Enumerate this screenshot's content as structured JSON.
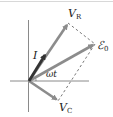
{
  "diagram": {
    "type": "phasor-diagram",
    "labels": {
      "vr": {
        "main": "V",
        "sub": "R"
      },
      "emf": {
        "main": "ℰ",
        "sub": "0"
      },
      "current": {
        "main": "I"
      },
      "vc": {
        "main": "V",
        "sub": "C"
      },
      "angle": "ωt"
    },
    "colors": {
      "axis": "#8a8a8a",
      "phasor": "#8c8c8c",
      "current_phasor": "#333333",
      "dashed": "#555555",
      "text": "#222222"
    },
    "geometry": {
      "origin": [
        29,
        81
      ],
      "vr_tip": [
        68,
        23
      ],
      "emf_tip": [
        95,
        44
      ],
      "current_tip": [
        46,
        53
      ],
      "vc_tip": [
        58,
        101
      ]
    }
  }
}
